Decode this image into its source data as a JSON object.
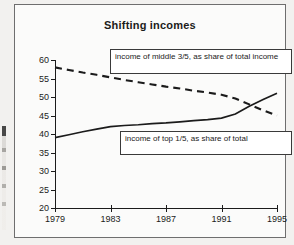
{
  "chart_data": {
    "type": "line",
    "title": "Shifting incomes",
    "xlabel": "",
    "ylabel": "",
    "xlim": [
      1979,
      1995
    ],
    "ylim": [
      20,
      60
    ],
    "grid": false,
    "legend_position": "inside-boxes",
    "x_ticks": [
      "1979",
      "1983",
      "1987",
      "1991",
      "1995"
    ],
    "y_ticks": [
      "20",
      "25",
      "30",
      "35",
      "40",
      "45",
      "50",
      "55",
      "60"
    ],
    "x": [
      1979,
      1980,
      1981,
      1982,
      1983,
      1984,
      1985,
      1986,
      1987,
      1988,
      1989,
      1990,
      1991,
      1992,
      1993,
      1994,
      1995
    ],
    "series": [
      {
        "name": "income of middle 3/5, as share of total income",
        "style": "dashed",
        "color": "#1b1b1b",
        "values": [
          58.0,
          57.3,
          56.6,
          56.0,
          55.3,
          54.6,
          54.0,
          53.4,
          52.8,
          52.3,
          51.7,
          51.2,
          50.6,
          49.6,
          48.0,
          46.4,
          45.0
        ]
      },
      {
        "name": "income of top 1/5, as share of total",
        "style": "solid",
        "color": "#1b1b1b",
        "values": [
          39.0,
          39.8,
          40.6,
          41.3,
          42.0,
          42.3,
          42.5,
          42.8,
          43.0,
          43.3,
          43.6,
          43.9,
          44.3,
          45.4,
          47.5,
          49.3,
          51.0
        ]
      }
    ],
    "annotations": [
      {
        "id": "legend-middle",
        "text": "income of middle 3/5, as share of total income"
      },
      {
        "id": "legend-top",
        "text": "income of top 1/5, as share of total"
      }
    ],
    "colors": {
      "ink": "#1b1b1b",
      "frame": "#6e6e6e",
      "plot_background": "#fbfbfa",
      "page_background": "#f2f1ef"
    }
  }
}
